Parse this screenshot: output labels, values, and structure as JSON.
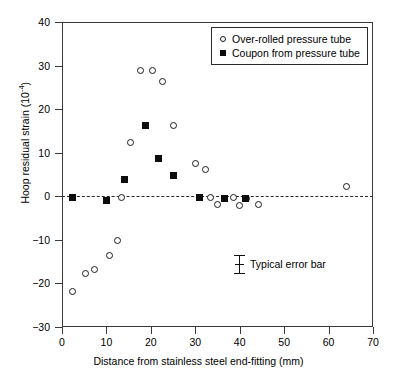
{
  "chart_data": {
    "type": "scatter",
    "title": "",
    "xlabel": "Distance from stainless steel end-fitting (mm)",
    "ylabel": "Hoop residual strain (10",
    "ylabel_exponent": "-4",
    "ylabel_suffix": ")",
    "xlim": [
      0,
      70
    ],
    "ylim": [
      -30,
      40
    ],
    "xticks": [
      0,
      10,
      20,
      30,
      40,
      50,
      60,
      70
    ],
    "yticks": [
      40,
      30,
      20,
      10,
      0,
      -10,
      -20,
      -30
    ],
    "ytick_labels": [
      "40",
      "30",
      "20",
      "10",
      "0",
      "−10",
      "−20",
      "−30"
    ],
    "xtick_labels": [
      "0",
      "10",
      "20",
      "30",
      "40",
      "50",
      "60",
      "70"
    ],
    "grid": false,
    "reference_line": {
      "y": 0,
      "style": "dashed"
    },
    "legend": {
      "position": "top-right"
    },
    "series": [
      {
        "name": "Over-rolled pressure tube",
        "marker": "open-circle",
        "points": [
          [
            2.3,
            -21.8
          ],
          [
            5.2,
            -17.8
          ],
          [
            7.4,
            -16.9
          ],
          [
            10.6,
            -13.5
          ],
          [
            12.6,
            -10.2
          ],
          [
            13.5,
            -0.3
          ],
          [
            15.5,
            12.4
          ],
          [
            17.6,
            28.9
          ],
          [
            20.3,
            28.8
          ],
          [
            22.7,
            26.3
          ],
          [
            25.0,
            16.3
          ],
          [
            30.0,
            7.6
          ],
          [
            32.4,
            6.1
          ],
          [
            33.5,
            -0.2
          ],
          [
            35.1,
            -1.9
          ],
          [
            38.5,
            -0.3
          ],
          [
            40.0,
            -2.0
          ],
          [
            41.6,
            -0.4
          ],
          [
            44.3,
            -1.9
          ],
          [
            64.0,
            2.3
          ]
        ]
      },
      {
        "name": "Coupon from pressure tube",
        "marker": "filled-square",
        "points": [
          [
            2.3,
            -0.2
          ],
          [
            10.1,
            -0.9
          ],
          [
            14.0,
            3.9
          ],
          [
            18.7,
            16.3
          ],
          [
            21.8,
            8.7
          ],
          [
            25.2,
            4.8
          ],
          [
            31.0,
            -0.3
          ],
          [
            36.6,
            -0.5
          ],
          [
            41.2,
            -0.4
          ]
        ]
      }
    ],
    "annotations": [
      {
        "name": "typical-error-bar",
        "label": "Typical error bar",
        "x": 39.5,
        "y": -20.5
      }
    ]
  },
  "colors": {
    "axis": "#3a3a3a",
    "marker": "#0d0d0d",
    "background": "#ffffff",
    "reference_line": "#2a2a2a"
  }
}
